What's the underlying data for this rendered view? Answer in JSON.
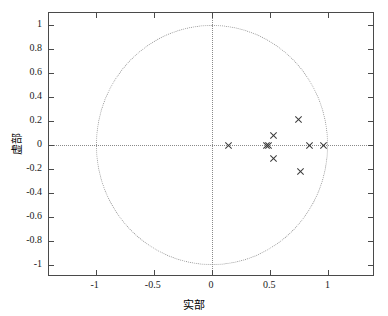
{
  "chart_data": {
    "type": "scatter",
    "title": "",
    "xlabel": "实部",
    "ylabel": "虚部",
    "xlim": [
      -1.4,
      1.4
    ],
    "ylim": [
      -1.1,
      1.1
    ],
    "xticks": [
      -1,
      -0.5,
      0,
      0.5,
      1
    ],
    "xticklabels": [
      "-1",
      "-0.5",
      "0",
      "0.5",
      "1"
    ],
    "yticks": [
      1,
      0.8,
      0.6,
      0.4,
      0.2,
      0,
      -0.2,
      -0.4,
      -0.6,
      -0.8,
      -1
    ],
    "yticklabels": [
      "1",
      "0.8",
      "0.6",
      "0.4",
      "0.2",
      "0",
      "-0.2",
      "-0.4",
      "-0.6",
      "-0.8",
      "-1"
    ],
    "grid": false,
    "marker": "x",
    "marker_color": "#3a3a3a",
    "series": [
      {
        "name": "zeros",
        "marker": "x",
        "points": [
          {
            "x": 0.14,
            "y": 0.0
          },
          {
            "x": 0.46,
            "y": 0.0
          },
          {
            "x": 0.48,
            "y": 0.0
          },
          {
            "x": 0.83,
            "y": 0.0
          },
          {
            "x": 0.95,
            "y": 0.0
          },
          {
            "x": 0.52,
            "y": 0.08
          },
          {
            "x": 0.52,
            "y": -0.11
          },
          {
            "x": 0.74,
            "y": 0.21
          },
          {
            "x": 0.76,
            "y": -0.22
          }
        ]
      }
    ],
    "annotations": [
      {
        "name": "unit-circle",
        "type": "circle",
        "cx": 0,
        "cy": 0,
        "r": 1,
        "linestyle": "dotted"
      },
      {
        "name": "real-axis",
        "type": "hline",
        "y": 0,
        "linestyle": "dotted"
      },
      {
        "name": "imag-axis",
        "type": "vline",
        "x": 0,
        "linestyle": "dotted"
      }
    ]
  }
}
